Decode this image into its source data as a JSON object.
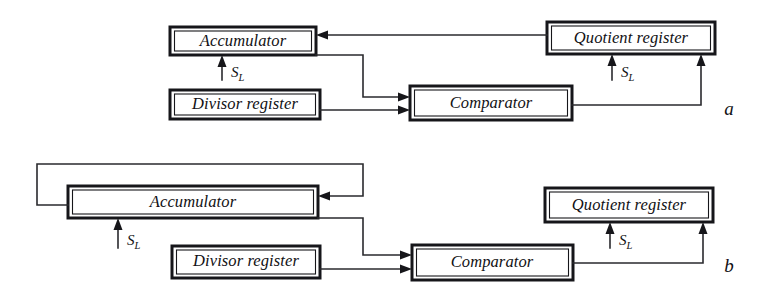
{
  "figure": {
    "type": "block-diagram",
    "caption_labels": [
      "a",
      "b"
    ],
    "background_color": "#ffffff",
    "ink_color": "#16161a"
  },
  "diagram_a": {
    "panel_label": "a",
    "blocks": {
      "accumulator": "Accumulator",
      "divisor_register": "Divisor register",
      "comparator": "Comparator",
      "quotient_register": "Quotient register"
    },
    "signals": {
      "accumulator_shift": "S",
      "accumulator_shift_sub": "L",
      "quotient_shift": "S",
      "quotient_shift_sub": "L"
    },
    "connections": [
      {
        "from": "quotient_register",
        "to": "accumulator",
        "style": "horizontal-arrow-left"
      },
      {
        "from": "accumulator",
        "to": "comparator",
        "style": "step-down-arrow-right"
      },
      {
        "from": "divisor_register",
        "to": "comparator",
        "style": "horizontal-arrow-right"
      },
      {
        "from": "comparator",
        "to": "quotient_register",
        "style": "step-up-arrow-up"
      },
      {
        "from": "shift-input",
        "to": "accumulator",
        "style": "vertical-arrow-up"
      },
      {
        "from": "shift-input",
        "to": "quotient_register",
        "style": "vertical-arrow-up"
      }
    ]
  },
  "diagram_b": {
    "panel_label": "b",
    "blocks": {
      "accumulator": "Accumulator",
      "divisor_register": "Divisor register",
      "comparator": "Comparator",
      "quotient_register": "Quotient register"
    },
    "signals": {
      "accumulator_shift": "S",
      "accumulator_shift_sub": "L",
      "quotient_shift": "S",
      "quotient_shift_sub": "L"
    },
    "connections": [
      {
        "from": "accumulator",
        "to": "accumulator",
        "style": "feedback-loop-over-top-arrow-right"
      },
      {
        "from": "accumulator",
        "to": "comparator",
        "style": "step-down-arrow-right"
      },
      {
        "from": "divisor_register",
        "to": "comparator",
        "style": "horizontal-arrow-right"
      },
      {
        "from": "comparator",
        "to": "quotient_register",
        "style": "step-up-arrow-up"
      },
      {
        "from": "shift-input",
        "to": "accumulator",
        "style": "vertical-arrow-up"
      },
      {
        "from": "shift-input",
        "to": "quotient_register",
        "style": "vertical-arrow-up"
      }
    ]
  }
}
